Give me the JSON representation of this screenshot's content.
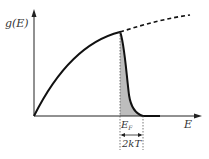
{
  "diagram": {
    "y_axis_label": "g(E)",
    "x_axis_label": "E",
    "fermi_label": "E",
    "fermi_subscript": "F",
    "width_label": "2kT",
    "colors": {
      "curve": "#111111",
      "shade": "#b8b8b8",
      "axis": "#222222"
    }
  }
}
